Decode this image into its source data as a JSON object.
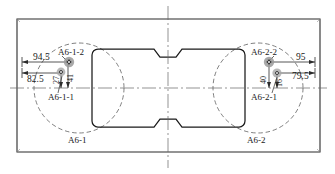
{
  "drawing": {
    "title": "A6 weld point layout",
    "colors": {
      "outline": "#1a1a1a",
      "frame": "#2b2b2b",
      "construction": "#555555",
      "centerline": "#666666",
      "marker_fill": "#9a9a9a",
      "marker_core": "#3a3a3a",
      "dimension": "#2b2b2b",
      "background": "#ffffff"
    },
    "dimensions": {
      "left_upper": "94.5",
      "left_lower": "82.5",
      "right_upper": "95",
      "right_lower": "79.5",
      "left_vert_inner": "27",
      "left_vert_outer": "41",
      "right_vert_inner": "40",
      "right_vert_outer": "16"
    },
    "point_labels": {
      "left_upper": "A6-1-2",
      "left_lower": "A6-1-1",
      "right_upper": "A6-2-2",
      "right_lower": "A6-2-1"
    },
    "region_labels": {
      "left": "A6-1",
      "right": "A6-2"
    }
  }
}
